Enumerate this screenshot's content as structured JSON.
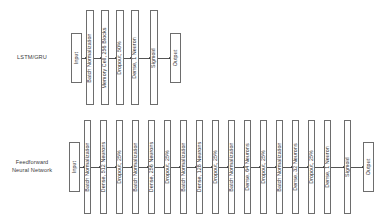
{
  "diagram": {
    "background_color": "#ffffff",
    "box_border_color": "#6d6d6d",
    "arrow_color": "#555555",
    "text_color": "#2e2e2e"
  },
  "rows": [
    {
      "id": "lstm-gru",
      "label": "LSTM/GRU",
      "label_x": 32,
      "label_y": 57,
      "short_box_top": 33,
      "short_box_height": 50,
      "tall_box_top": 10,
      "tall_box_height": 95,
      "nodes": [
        {
          "name": "input",
          "text": "Input",
          "x": 71,
          "width": 11,
          "tall": false
        },
        {
          "name": "batch-normalization",
          "text": "Batch Normalization",
          "x": 86,
          "width": 8,
          "tall": true
        },
        {
          "name": "memory-cell",
          "text": "Memory Cell, 256 Blocks",
          "x": 101,
          "width": 8,
          "tall": true
        },
        {
          "name": "dropout",
          "text": "Dropout, 50%",
          "x": 116,
          "width": 8,
          "tall": true
        },
        {
          "name": "dense",
          "text": "Dense, 1 Neuron",
          "x": 131,
          "width": 8,
          "tall": true
        },
        {
          "name": "sigmoid",
          "text": "Sigmoid",
          "x": 150,
          "width": 8,
          "tall": true
        },
        {
          "name": "output",
          "text": "Output",
          "x": 170,
          "width": 11,
          "tall": false
        }
      ]
    },
    {
      "id": "feedforward-neural-network",
      "label": "Feedforward\nNeural Network",
      "label_x": 32,
      "label_y": 166,
      "short_box_top": 142,
      "short_box_height": 50,
      "tall_box_top": 120,
      "tall_box_height": 94,
      "nodes": [
        {
          "name": "input",
          "text": "Input",
          "x": 69,
          "width": 11,
          "tall": false
        },
        {
          "name": "batch-normalization-1",
          "text": "Batch Normalization",
          "x": 84,
          "width": 7,
          "tall": true
        },
        {
          "name": "dense-512",
          "text": "Dense, 512 Neurons",
          "x": 100,
          "width": 7,
          "tall": true
        },
        {
          "name": "dropout-1",
          "text": "Dropout, 25%",
          "x": 116,
          "width": 7,
          "tall": true
        },
        {
          "name": "batch-normalization-2",
          "text": "Batch Normalization",
          "x": 132,
          "width": 7,
          "tall": true
        },
        {
          "name": "dense-256",
          "text": "Dense, 256 Neurons",
          "x": 148,
          "width": 7,
          "tall": true
        },
        {
          "name": "dropout-2",
          "text": "Dropout, 25%",
          "x": 164,
          "width": 7,
          "tall": true
        },
        {
          "name": "batch-normalization-3",
          "text": "Batch Normalization",
          "x": 180,
          "width": 7,
          "tall": true
        },
        {
          "name": "dense-128",
          "text": "Dense, 128 Neurons",
          "x": 196,
          "width": 7,
          "tall": true
        },
        {
          "name": "dropout-3",
          "text": "Dropout, 25%",
          "x": 212,
          "width": 7,
          "tall": true
        },
        {
          "name": "batch-normalization-4",
          "text": "Batch Normalization",
          "x": 228,
          "width": 7,
          "tall": true
        },
        {
          "name": "dense-64",
          "text": "Dense, 64 Neurons",
          "x": 244,
          "width": 7,
          "tall": true
        },
        {
          "name": "dropout-4",
          "text": "Dropout, 25%",
          "x": 260,
          "width": 7,
          "tall": true
        },
        {
          "name": "batch-normalization-5",
          "text": "Batch Normalization",
          "x": 276,
          "width": 7,
          "tall": true
        },
        {
          "name": "dense-32",
          "text": "Dense, 32 Neurons",
          "x": 292,
          "width": 7,
          "tall": true
        },
        {
          "name": "dropout-5",
          "text": "Dropout, 25%",
          "x": 308,
          "width": 7,
          "tall": true
        },
        {
          "name": "dense-1",
          "text": "Dense, 1 Neuron",
          "x": 324,
          "width": 7,
          "tall": true
        },
        {
          "name": "sigmoid",
          "text": "Sigmoid",
          "x": 344,
          "width": 7,
          "tall": true
        },
        {
          "name": "output",
          "text": "Output",
          "x": 363,
          "width": 11,
          "tall": false
        }
      ]
    }
  ]
}
